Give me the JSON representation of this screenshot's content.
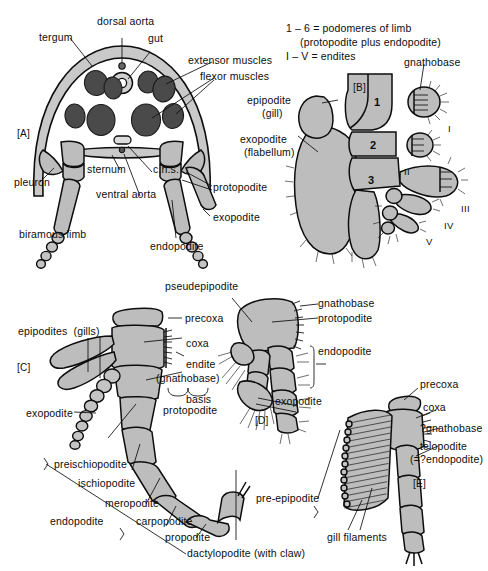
{
  "figure": {
    "panels": [
      "[A]",
      "[B]",
      "[C]",
      "[D]",
      "[E]"
    ]
  },
  "colors": {
    "muscle": "#4a4a4a",
    "cuticle": "#c9c9c9",
    "limb": "#bdbdbd",
    "outline": "#0d0d0d",
    "background": "#ffffff"
  },
  "key": {
    "line1": "1 – 6 = podomeres of limb",
    "line2": "(protopodite plus endopodite)",
    "line3": "I – V = endites"
  },
  "panel_a": {
    "tag": "[A]",
    "labels": {
      "dorsal_aorta": "dorsal aorta",
      "gut": "gut",
      "tergum": "tergum",
      "extensor_muscles": "extensor muscles",
      "flexor_muscles": "flexor muscles",
      "pleuron": "pleuron",
      "sternum": "sternum",
      "cns": "c.n.s.",
      "ventral_aorta": "ventral aorta",
      "biramous_limb": "biramous limb",
      "protopodite": "protopodite",
      "exopodite": "exopodite",
      "endopodite": "endopodite"
    }
  },
  "panel_b": {
    "tag": "[B]",
    "labels": {
      "epipodite": "epipodite",
      "epipodite_sub": "(gill)",
      "exopodite": "exopodite",
      "exopodite_sub": "(flabellum)",
      "gnathobase": "gnathobase"
    },
    "podomeres": [
      "1",
      "2",
      "3"
    ],
    "endites": [
      "I",
      "II",
      "III",
      "IV",
      "V"
    ]
  },
  "panel_c": {
    "tag": "[C]",
    "labels": {
      "epipodites": "epipodites  (gills)",
      "precoxa": "precoxa",
      "coxa": "coxa",
      "endite": "endite",
      "endite_sub": "(gnathobase)",
      "basis": "basis",
      "protopodite": "protopodite",
      "exopodite": "exopodite",
      "preischiopodite": "preischiopodite",
      "ischiopodite": "ischiopodite",
      "meropodite": "meropodite",
      "carpopodite": "carpopodite",
      "propodite": "propodite",
      "dactylopodite": "dactylopodite (with claw)",
      "endopodite": "endopodite"
    }
  },
  "panel_d": {
    "tag": "[D]",
    "labels": {
      "pseudepipodite": "pseudepipodite",
      "gnathobase": "gnathobase",
      "protopodite": "protopodite",
      "endopodite": "endopodite",
      "exopodite": "exopodite"
    }
  },
  "panel_e": {
    "tag": "[E]",
    "labels": {
      "precoxa": "precoxa",
      "coxa": "coxa",
      "gnathobase": "?gnathobase",
      "telopodite": "telopodite",
      "telopodite_sub": "(=?endopodite)",
      "pre_epipodite": "pre-epipodite",
      "gill_filaments": "gill filaments"
    }
  }
}
